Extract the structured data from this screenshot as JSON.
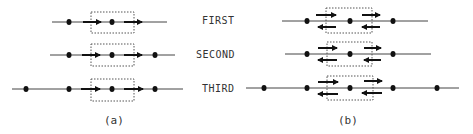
{
  "row_labels": [
    "FIRST",
    "SECOND",
    "THIRD"
  ],
  "captions": {
    "a": "(a)",
    "b": "(b)"
  },
  "colors": {
    "line": "#444444",
    "dot": "#111111",
    "arrow": "#111111",
    "box": "#555555"
  },
  "panel_a": {
    "description": "Unidirectional: arrows point right only",
    "rows": [
      {
        "label": "FIRST",
        "nodes": 2
      },
      {
        "label": "SECOND",
        "nodes": 3
      },
      {
        "label": "THIRD",
        "nodes": 4
      }
    ]
  },
  "panel_b": {
    "description": "Bidirectional: arrows point right above the line and left below",
    "rows": [
      {
        "label": "FIRST",
        "nodes": 3
      },
      {
        "label": "SECOND",
        "nodes": 3
      },
      {
        "label": "THIRD",
        "nodes": 5
      }
    ]
  }
}
